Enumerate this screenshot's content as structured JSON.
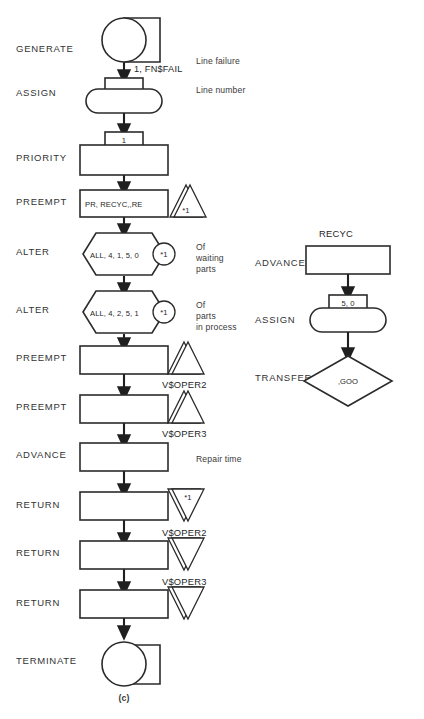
{
  "figure": {
    "caption": "(c)",
    "bottom_cut_text": ""
  },
  "main_flow": {
    "blocks": [
      {
        "id": "generate",
        "label": "GENERATE",
        "shape": "circle-with-tab",
        "operand": "1, FN$FAIL",
        "annotation": "Line failure",
        "annotation_lines": [
          "Line failure"
        ],
        "top_text": "",
        "attachment": "",
        "attachment_text": ""
      },
      {
        "id": "assign",
        "label": "ASSIGN",
        "shape": "stadium-with-tab",
        "operand": "",
        "annotation": "Line number",
        "annotation_lines": [
          "Line number"
        ],
        "top_text": "",
        "attachment": "",
        "attachment_text": ""
      },
      {
        "id": "priority",
        "label": "PRIORITY",
        "shape": "rect-with-tab",
        "operand": "",
        "annotation": "",
        "annotation_lines": [],
        "top_text": "1",
        "attachment": "",
        "attachment_text": ""
      },
      {
        "id": "preempt-1",
        "label": "PREEMPT",
        "shape": "rect",
        "operand": "PR, RECYC,,RE",
        "annotation": "",
        "annotation_lines": [],
        "top_text": "",
        "attachment": "triangle-up-double",
        "attachment_text": "*1"
      },
      {
        "id": "alter-1",
        "label": "ALTER",
        "shape": "hexagon",
        "operand": "ALL, 4, 1, 5, 0",
        "annotation": "Of waiting parts",
        "annotation_lines": [
          "Of",
          "waiting",
          "parts"
        ],
        "top_text": "",
        "attachment": "circle",
        "attachment_text": "*1"
      },
      {
        "id": "alter-2",
        "label": "ALTER",
        "shape": "hexagon",
        "operand": "ALL, 4, 2, 5, 1",
        "annotation": "Of parts in process",
        "annotation_lines": [
          "Of",
          "parts",
          "in process"
        ],
        "top_text": "",
        "attachment": "circle",
        "attachment_text": "*1"
      },
      {
        "id": "preempt-2",
        "label": "PREEMPT",
        "shape": "rect",
        "operand": "",
        "annotation": "",
        "annotation_lines": [],
        "top_text": "",
        "attachment": "triangle-up-double",
        "attachment_text": "",
        "below_text": "V$OPER2"
      },
      {
        "id": "preempt-3",
        "label": "PREEMPT",
        "shape": "rect",
        "operand": "",
        "annotation": "",
        "annotation_lines": [],
        "top_text": "",
        "attachment": "triangle-up-double",
        "attachment_text": "",
        "below_text": "V$OPER3"
      },
      {
        "id": "advance",
        "label": "ADVANCE",
        "shape": "rect",
        "operand": "",
        "annotation": "Repair time",
        "annotation_lines": [
          "Repair time"
        ],
        "top_text": "",
        "attachment": "",
        "attachment_text": ""
      },
      {
        "id": "return-1",
        "label": "RETURN",
        "shape": "rect",
        "operand": "",
        "annotation": "",
        "annotation_lines": [],
        "top_text": "",
        "attachment": "triangle-down-double",
        "attachment_text": "*1",
        "below_text": "V$OPER2"
      },
      {
        "id": "return-2",
        "label": "RETURN",
        "shape": "rect",
        "operand": "",
        "annotation": "",
        "annotation_lines": [],
        "top_text": "",
        "attachment": "triangle-down-double",
        "attachment_text": "",
        "below_text": "V$OPER3"
      },
      {
        "id": "return-3",
        "label": "RETURN",
        "shape": "rect",
        "operand": "",
        "annotation": "",
        "annotation_lines": [],
        "top_text": "",
        "attachment": "triangle-down-double",
        "attachment_text": "",
        "below_text": ""
      },
      {
        "id": "terminate",
        "label": "TERMINATE",
        "shape": "circle-with-tab",
        "operand": "",
        "annotation": "",
        "annotation_lines": [],
        "top_text": "",
        "attachment": "",
        "attachment_text": ""
      }
    ]
  },
  "sub_flow": {
    "title": "RECYC",
    "blocks": [
      {
        "id": "advance-recyc",
        "label": "ADVANCE",
        "shape": "rect",
        "operand": "",
        "top_text": ""
      },
      {
        "id": "assign-recyc",
        "label": "ASSIGN",
        "shape": "stadium-with-tab",
        "operand": "",
        "top_text": "5, 0"
      },
      {
        "id": "transfer-recyc",
        "label": "TRANSFER",
        "shape": "diamond",
        "operand": ",GOO",
        "top_text": ""
      }
    ]
  },
  "colors": {
    "stroke": "#2b2b2b",
    "connector": "#1f1f1f",
    "text": "#2a2a2a",
    "background": "#ffffff"
  }
}
